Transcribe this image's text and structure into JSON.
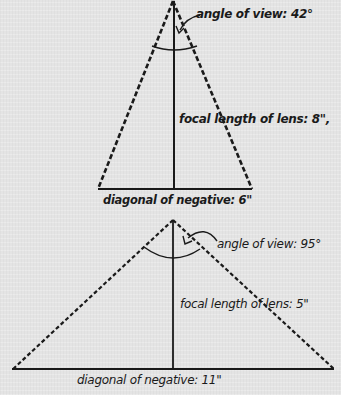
{
  "diagram": {
    "colors": {
      "ink": "#1a1a1a",
      "paper": "#e4e4e4"
    },
    "triangles": [
      {
        "id": "long-lens",
        "angle_label": "angle of view: 42°",
        "focal_label": "focal length of lens: 8\",",
        "diagonal_label": "diagonal of negative: 6\"",
        "angle_deg": 42,
        "focal_length_in": 8,
        "diagonal_in": 6
      },
      {
        "id": "wide-lens",
        "angle_label": "angle of view: 95°",
        "focal_label": "focal length of lens: 5\"",
        "diagonal_label": "diagonal of negative: 11\"",
        "angle_deg": 95,
        "focal_length_in": 5,
        "diagonal_in": 11
      }
    ]
  }
}
